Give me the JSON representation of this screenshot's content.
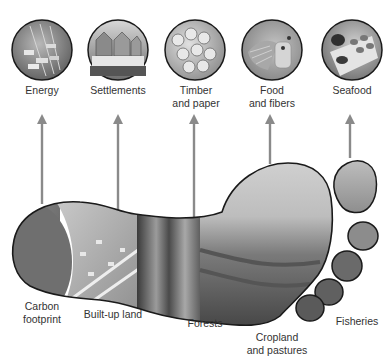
{
  "diagram": {
    "type": "ecological-footprint",
    "top_icons": [
      {
        "id": "energy",
        "label_line1": "Energy",
        "label_line2": "",
        "icon": "traffic-highway-icon"
      },
      {
        "id": "settlements",
        "label_line1": "Settlements",
        "label_line2": "",
        "icon": "houses-icon"
      },
      {
        "id": "timber",
        "label_line1": "Timber",
        "label_line2": "and paper",
        "icon": "log-stack-icon"
      },
      {
        "id": "food",
        "label_line1": "Food",
        "label_line2": "and fibers",
        "icon": "food-fibers-icon"
      },
      {
        "id": "seafood",
        "label_line1": "Seafood",
        "label_line2": "",
        "icon": "seafood-platter-icon"
      }
    ],
    "footprint_regions": [
      {
        "id": "carbon",
        "label_line1": "Carbon",
        "label_line2": "footprint"
      },
      {
        "id": "builtup",
        "label_line1": "Built-up land",
        "label_line2": ""
      },
      {
        "id": "forests",
        "label_line1": "Forests",
        "label_line2": ""
      },
      {
        "id": "cropland",
        "label_line1": "Cropland",
        "label_line2": "and pastures"
      },
      {
        "id": "fisheries",
        "label_line1": "Fisheries",
        "label_line2": ""
      }
    ],
    "colors": {
      "arrow": "#8a8a8a",
      "outline": "#1a1a1a",
      "background": "#ffffff"
    }
  }
}
